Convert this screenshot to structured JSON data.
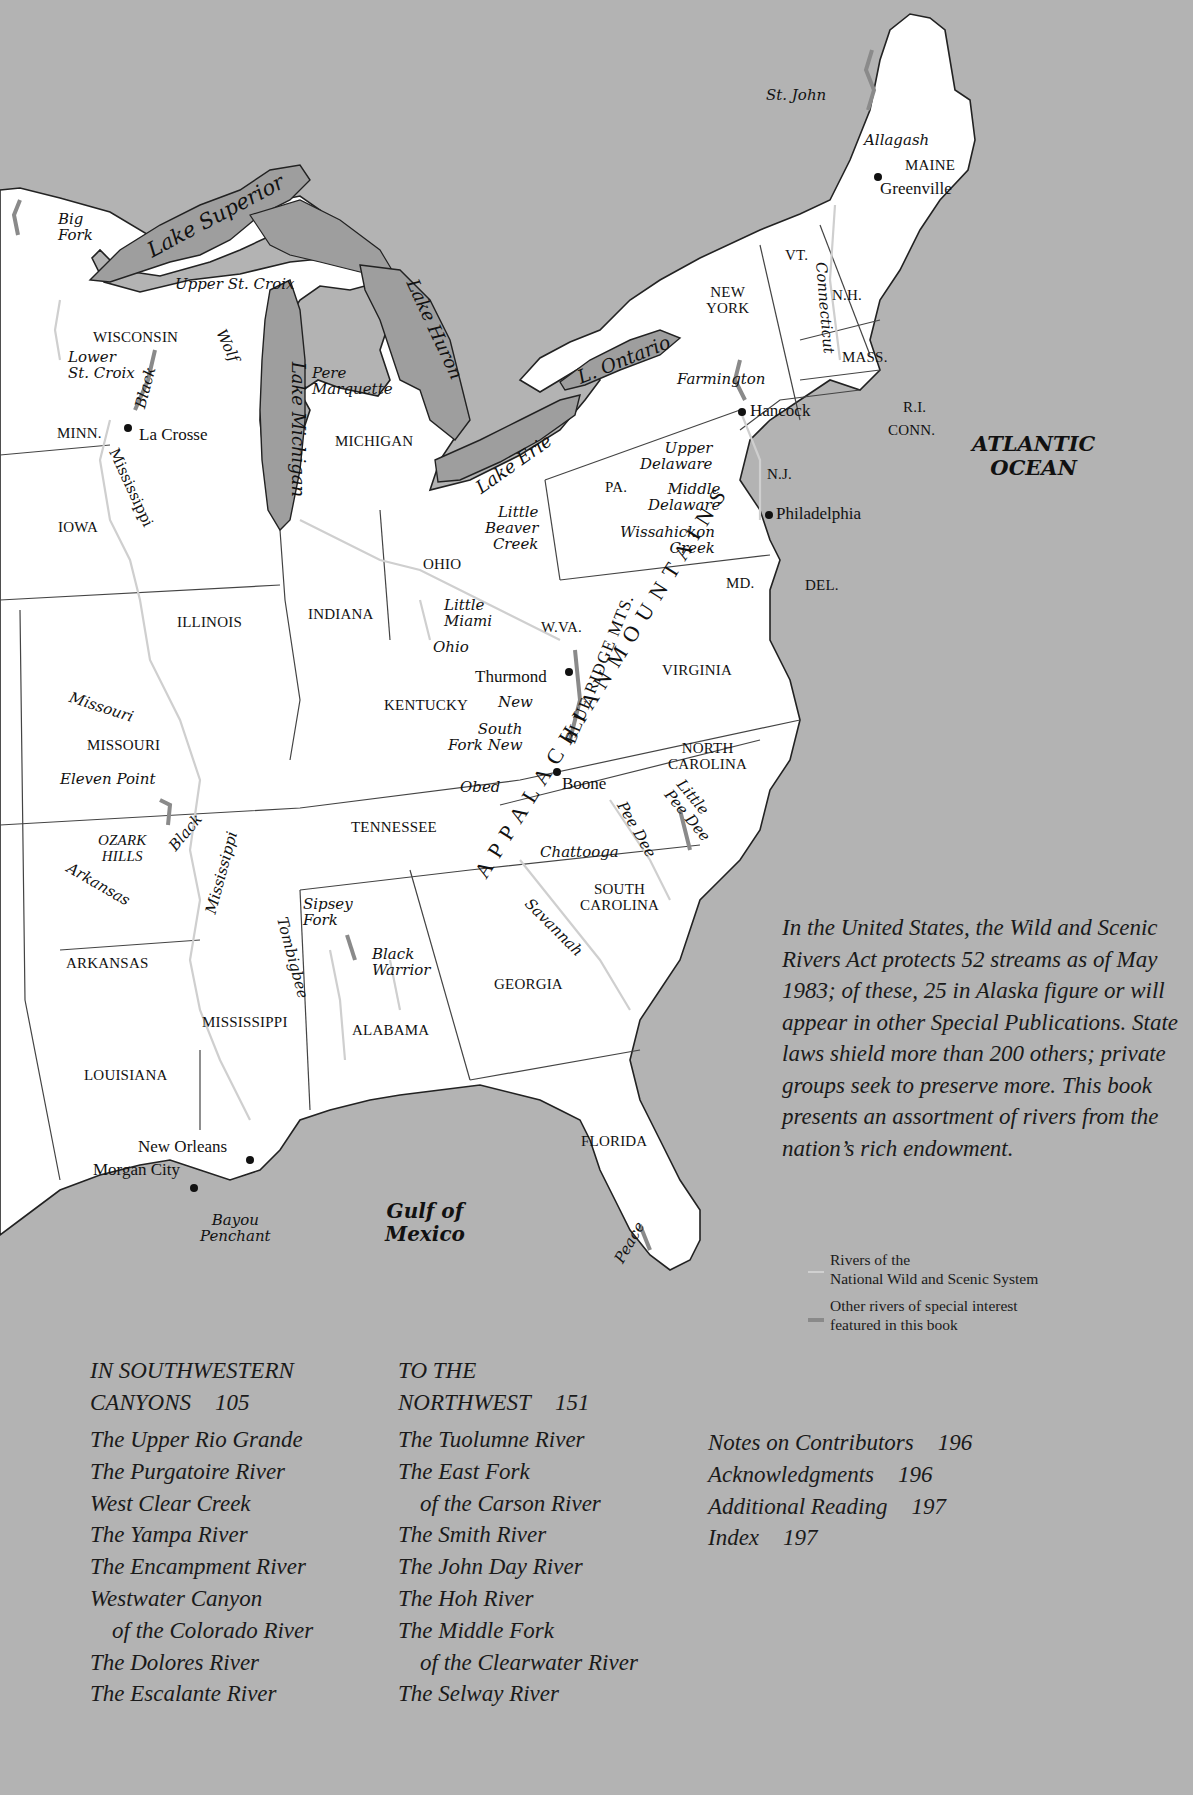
{
  "map": {
    "water_bodies": {
      "lake_superior": "Lake Superior",
      "lake_michigan": "Lake Michigan",
      "lake_huron": "Lake Huron",
      "lake_erie": "Lake Erie",
      "lake_ontario": "L. Ontario",
      "atlantic_line1": "ATLANTIC",
      "atlantic_line2": "OCEAN",
      "gulf_line1": "Gulf of",
      "gulf_line2": "Mexico"
    },
    "states": {
      "maine": "MAINE",
      "vt": "VT.",
      "nh": "N.H.",
      "new_york_1": "NEW",
      "new_york_2": "YORK",
      "mass": "MASS.",
      "ri": "R.I.",
      "conn": "CONN.",
      "nj": "N.J.",
      "pa": "PA.",
      "md": "MD.",
      "del": "DEL.",
      "wisconsin": "WISCONSIN",
      "minn": "MINN.",
      "michigan": "MICHIGAN",
      "iowa": "IOWA",
      "ohio": "OHIO",
      "illinois": "ILLINOIS",
      "indiana": "INDIANA",
      "wva": "W.VA.",
      "virginia": "VIRGINIA",
      "kentucky": "KENTUCKY",
      "missouri": "MISSOURI",
      "north_carolina_1": "NORTH",
      "north_carolina_2": "CAROLINA",
      "tennessee": "TENNESSEE",
      "ozark_1": "OZARK",
      "ozark_2": "HILLS",
      "south_carolina_1": "SOUTH",
      "south_carolina_2": "CAROLINA",
      "arkansas": "ARKANSAS",
      "georgia": "GEORGIA",
      "mississippi": "MISSISSIPPI",
      "alabama": "ALABAMA",
      "louisiana": "LOUISIANA",
      "florida": "FLORIDA"
    },
    "cities": {
      "greenville": "Greenville",
      "hancock": "Hancock",
      "philadelphia": "Philadelphia",
      "la_crosse": "La Crosse",
      "thurmond": "Thurmond",
      "boone": "Boone",
      "new_orleans": "New Orleans",
      "morgan_city": "Morgan City"
    },
    "rivers": {
      "st_john": "St. John",
      "allagash": "Allagash",
      "big_fork_1": "Big",
      "big_fork_2": "Fork",
      "upper_st_croix": "Upper St. Croix",
      "wolf": "Wolf",
      "lower_st_croix_1": "Lower",
      "lower_st_croix_2": "St. Croix",
      "black_wi": "Black",
      "pere_marquette_1": "Pere",
      "pere_marquette_2": "Marquette",
      "connecticut": "Connecticut",
      "farmington": "Farmington",
      "upper_delaware_1": "Upper",
      "upper_delaware_2": "Delaware",
      "middle_delaware_1": "Middle",
      "middle_delaware_2": "Delaware",
      "wissahickon_1": "Wissahickon",
      "wissahickon_2": "Creek",
      "mississippi_n": "Mississippi",
      "little_beaver_1": "Little",
      "little_beaver_2": "Beaver",
      "little_beaver_3": "Creek",
      "little_miami_1": "Little",
      "little_miami_2": "Miami",
      "ohio": "Ohio",
      "new": "New",
      "south_fork_new_1": "South",
      "south_fork_new_2": "Fork New",
      "missouri": "Missouri",
      "eleven_point": "Eleven Point",
      "obed": "Obed",
      "black_mo": "Black",
      "arkansas": "Arkansas",
      "mississippi_s": "Mississippi",
      "little_pee_dee_1": "Little",
      "little_pee_dee_2": "Pee Dee",
      "pee_dee": "Pee Dee",
      "chattooga": "Chattooga",
      "savannah": "Savannah",
      "sipsey_1": "Sipsey",
      "sipsey_2": "Fork",
      "tombigbee": "Tombigbee",
      "black_warrior_1": "Black",
      "black_warrior_2": "Warrior",
      "bayou_1": "Bayou",
      "bayou_2": "Penchant",
      "peace": "Peace"
    },
    "mountains": {
      "appalachian": "A P P A L A C H I A N   M O U N T A I N S",
      "blue_ridge": "BLUE RIDGE MTS."
    },
    "colors": {
      "background": "#b3b3b3",
      "land": "#ffffff",
      "lake": "#9e9e9e",
      "border": "#444444",
      "national_river": "#d0d0d0",
      "special_river": "#8a8a8a"
    }
  },
  "intro_text": "In the United States, the Wild and Scenic Rivers Act protects 52 streams as of May 1983; of these, 25 in Alaska figure or will appear in other Special Publications. State laws shield more than 200 others; private groups seek to preserve more. This book presents an assortment of rivers from the nation’s rich endowment.",
  "legend": {
    "national_1": "Rivers of the",
    "national_2": "National Wild and Scenic System",
    "other_1": "Other rivers of special interest",
    "other_2": "featured in this book"
  },
  "toc": {
    "southwest": {
      "heading_1": "IN SOUTHWESTERN",
      "heading_2": "CANYONS",
      "page": "105",
      "items": [
        "The Upper Rio Grande",
        "The Purgatoire River",
        "West Clear Creek",
        "The Yampa River",
        "The Encampment River",
        "Westwater Canyon",
        "of the Colorado River",
        "The Dolores River",
        "The Escalante River"
      ]
    },
    "northwest": {
      "heading_1": "TO THE",
      "heading_2": "NORTHWEST",
      "page": "151",
      "items": [
        "The Tuolumne River",
        "The East Fork",
        "of the Carson River",
        "The Smith River",
        "The John Day River",
        "The Hoh River",
        "The Middle Fork",
        "of the Clearwater River",
        "The Selway River"
      ]
    },
    "back_matter": [
      {
        "label": "Notes on Contributors",
        "page": "196"
      },
      {
        "label": "Acknowledgments",
        "page": "196"
      },
      {
        "label": "Additional Reading",
        "page": "197"
      },
      {
        "label": "Index",
        "page": "197"
      }
    ]
  }
}
